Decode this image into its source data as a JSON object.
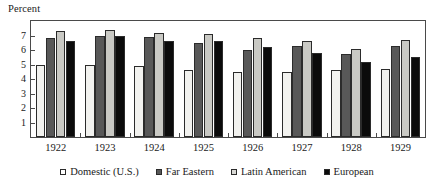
{
  "chart_data": {
    "type": "bar",
    "title": "",
    "subtitle": "",
    "xlabel": "",
    "ylabel": "Percent",
    "ylim": [
      0,
      8
    ],
    "yticks": [
      1,
      2,
      3,
      4,
      5,
      6,
      7
    ],
    "ytick_labels": [
      "1",
      "2",
      "3",
      "4",
      "5",
      "6",
      "7"
    ],
    "grid": false,
    "legend_position": "bottom",
    "categories": [
      "1922",
      "1923",
      "1924",
      "1925",
      "1926",
      "1927",
      "1928",
      "1929"
    ],
    "series": [
      {
        "name": "Domestic (U.S.)",
        "color": "#f2f2ef",
        "values": [
          5.0,
          5.0,
          4.9,
          4.6,
          4.5,
          4.5,
          4.6,
          4.7
        ]
      },
      {
        "name": "Far Eastern",
        "color": "#585858",
        "values": [
          6.8,
          7.0,
          6.9,
          6.5,
          6.0,
          6.3,
          5.7,
          6.3
        ]
      },
      {
        "name": "Latin American",
        "color": "#c9c9c4",
        "values": [
          7.3,
          7.4,
          7.2,
          7.1,
          6.8,
          6.6,
          6.1,
          6.7
        ]
      },
      {
        "name": "European",
        "color": "#0b0b0b",
        "values": [
          6.6,
          7.0,
          6.6,
          6.6,
          6.2,
          5.8,
          5.2,
          5.5
        ]
      }
    ]
  }
}
